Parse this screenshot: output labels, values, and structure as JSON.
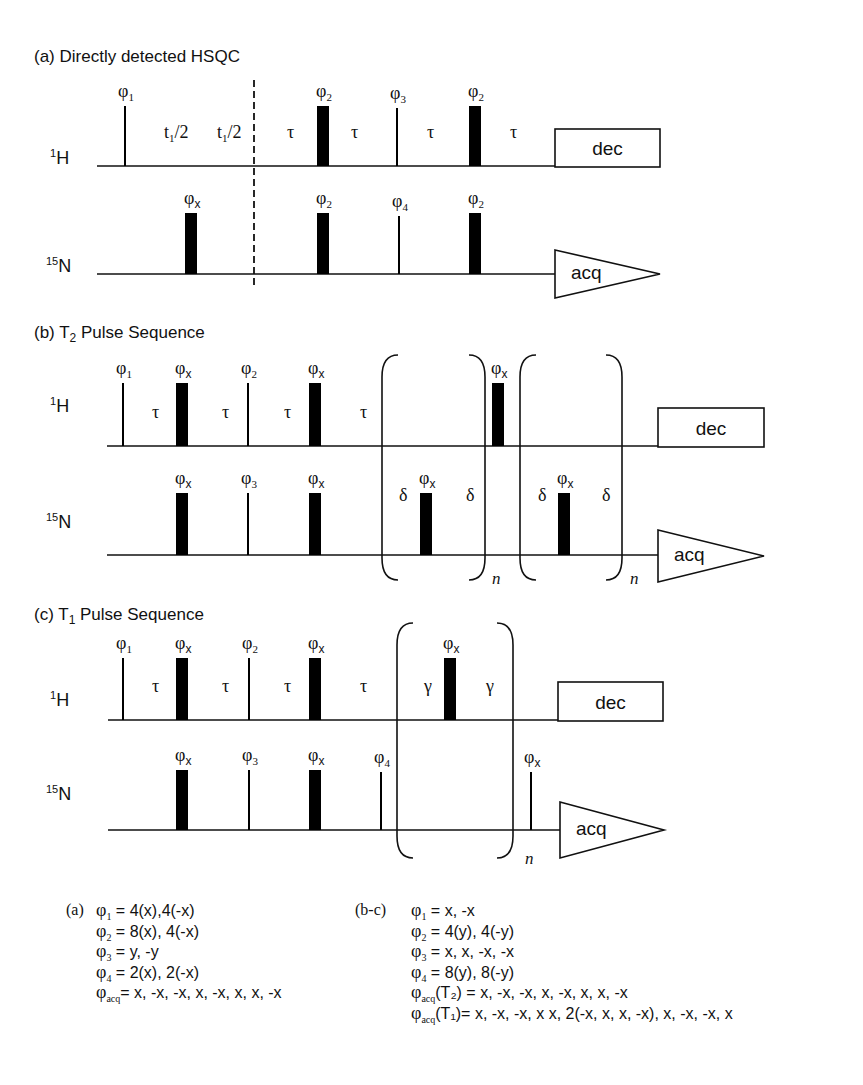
{
  "figure": {
    "panels": [
      {
        "id": "a",
        "title": "(a) Directly detected HSQC",
        "title_pos": [
          34,
          62
        ],
        "channels": [
          {
            "label_sup": "1",
            "label_main": "H",
            "label_pos": [
              50,
              164
            ],
            "baseline_y": 166,
            "x_start": 97,
            "x_end": 555
          },
          {
            "label_sup": "15",
            "label_main": "N",
            "label_pos": [
              46,
              272
            ],
            "baseline_y": 274,
            "x_start": 97,
            "x_end": 555
          }
        ],
        "pulses": [
          {
            "ch": 0,
            "x": 125,
            "w": 2,
            "h": 60,
            "phase": "φ",
            "sub": "1"
          },
          {
            "ch": 0,
            "x": 323,
            "w": 12,
            "h": 60,
            "phase": "φ",
            "sub": "2"
          },
          {
            "ch": 0,
            "x": 397,
            "w": 2,
            "h": 58,
            "phase": "φ",
            "sub": "3"
          },
          {
            "ch": 0,
            "x": 475,
            "w": 12,
            "h": 60,
            "phase": "φ",
            "sub": "2"
          },
          {
            "ch": 1,
            "x": 191,
            "w": 12,
            "h": 61,
            "phase": "φ",
            "sub": "x"
          },
          {
            "ch": 1,
            "x": 323,
            "w": 12,
            "h": 61,
            "phase": "φ",
            "sub": "2"
          },
          {
            "ch": 1,
            "x": 399,
            "w": 2,
            "h": 58,
            "phase": "φ",
            "sub": "4"
          },
          {
            "ch": 1,
            "x": 475,
            "w": 12,
            "h": 61,
            "phase": "φ",
            "sub": "2"
          }
        ],
        "delays": [
          {
            "ch": 0,
            "x": 170,
            "text": "t",
            "sub": "1",
            "tail": "/2"
          },
          {
            "ch": 0,
            "x": 223,
            "text": "t",
            "sub": "1",
            "tail": "/2"
          },
          {
            "ch": 0,
            "x": 293,
            "text": "τ"
          },
          {
            "ch": 0,
            "x": 357,
            "text": "τ"
          },
          {
            "ch": 0,
            "x": 433,
            "text": "τ"
          },
          {
            "ch": 0,
            "x": 516,
            "text": "τ"
          }
        ],
        "dashed_line": {
          "x": 254,
          "y1": 80,
          "y2": 287
        },
        "dec": {
          "x": 555,
          "y": 129,
          "w": 105,
          "h": 38,
          "label": "dec"
        },
        "acq": {
          "x": 555,
          "y": 250,
          "w": 105,
          "h": 48,
          "label": "acq"
        },
        "brackets": []
      },
      {
        "id": "b",
        "title": "(b) T",
        "title_sub": "2",
        "title_tail": " Pulse Sequence",
        "title_pos": [
          34,
          338
        ],
        "channels": [
          {
            "label_sup": "1",
            "label_main": "H",
            "label_pos": [
              50,
              412
            ],
            "baseline_y": 446,
            "x_start": 107,
            "x_end": 658
          },
          {
            "label_sup": "15",
            "label_main": "N",
            "label_pos": [
              46,
              528
            ],
            "baseline_y": 555,
            "x_start": 107,
            "x_end": 658
          }
        ],
        "pulses": [
          {
            "ch": 0,
            "x": 123,
            "w": 2,
            "h": 63,
            "phase": "φ",
            "sub": "1"
          },
          {
            "ch": 0,
            "x": 182,
            "w": 12,
            "h": 63,
            "phase": "φ",
            "sub": "x"
          },
          {
            "ch": 0,
            "x": 248,
            "w": 2,
            "h": 63,
            "phase": "φ",
            "sub": "2"
          },
          {
            "ch": 0,
            "x": 315,
            "w": 12,
            "h": 63,
            "phase": "φ",
            "sub": "x"
          },
          {
            "ch": 0,
            "x": 498,
            "w": 12,
            "h": 63,
            "phase": "φ",
            "sub": "x"
          },
          {
            "ch": 1,
            "x": 182,
            "w": 12,
            "h": 62,
            "phase": "φ",
            "sub": "x"
          },
          {
            "ch": 1,
            "x": 248,
            "w": 2,
            "h": 62,
            "phase": "φ",
            "sub": "3"
          },
          {
            "ch": 1,
            "x": 315,
            "w": 12,
            "h": 62,
            "phase": "φ",
            "sub": "x"
          },
          {
            "ch": 1,
            "x": 426,
            "w": 12,
            "h": 62,
            "phase": "φ",
            "sub": "x"
          },
          {
            "ch": 1,
            "x": 564,
            "w": 12,
            "h": 62,
            "phase": "φ",
            "sub": "x"
          }
        ],
        "delays": [
          {
            "ch": 0,
            "x": 158,
            "text": "τ"
          },
          {
            "ch": 0,
            "x": 228,
            "text": "τ"
          },
          {
            "ch": 0,
            "x": 290,
            "text": "τ"
          },
          {
            "ch": 0,
            "x": 366,
            "text": "τ"
          },
          {
            "ch": 1,
            "x": 405,
            "text": "δ",
            "dy": -26
          },
          {
            "ch": 1,
            "x": 472,
            "text": "δ",
            "dy": -26
          },
          {
            "ch": 1,
            "x": 544,
            "text": "δ",
            "dy": -26
          },
          {
            "ch": 1,
            "x": 608,
            "text": "δ",
            "dy": -26
          }
        ],
        "dec": {
          "x": 658,
          "y": 408,
          "w": 106,
          "h": 39,
          "label": "dec"
        },
        "acq": {
          "x": 658,
          "y": 530,
          "w": 106,
          "h": 52,
          "label": "acq"
        },
        "brackets": [
          {
            "x1": 382,
            "x2": 485,
            "y1": 355,
            "y2": 580,
            "n_label": "n",
            "n_x": 492,
            "n_y": 584
          },
          {
            "x1": 520,
            "x2": 622,
            "y1": 355,
            "y2": 580,
            "n_label": "n",
            "n_x": 630,
            "n_y": 584
          }
        ]
      },
      {
        "id": "c",
        "title": "(c) T",
        "title_sub": "1",
        "title_tail": " Pulse Sequence",
        "title_pos": [
          34,
          620
        ],
        "channels": [
          {
            "label_sup": "1",
            "label_main": "H",
            "label_pos": [
              50,
              706
            ],
            "baseline_y": 720,
            "x_start": 108,
            "x_end": 558
          },
          {
            "label_sup": "15",
            "label_main": "N",
            "label_pos": [
              46,
              800
            ],
            "baseline_y": 830,
            "x_start": 108,
            "x_end": 560
          }
        ],
        "pulses": [
          {
            "ch": 0,
            "x": 123,
            "w": 2,
            "h": 62,
            "phase": "φ",
            "sub": "1"
          },
          {
            "ch": 0,
            "x": 182,
            "w": 12,
            "h": 62,
            "phase": "φ",
            "sub": "x"
          },
          {
            "ch": 0,
            "x": 249,
            "w": 2,
            "h": 62,
            "phase": "φ",
            "sub": "2"
          },
          {
            "ch": 0,
            "x": 315,
            "w": 12,
            "h": 62,
            "phase": "φ",
            "sub": "x"
          },
          {
            "ch": 0,
            "x": 450,
            "w": 12,
            "h": 62,
            "phase": "φ",
            "sub": "x"
          },
          {
            "ch": 1,
            "x": 182,
            "w": 12,
            "h": 60,
            "phase": "φ",
            "sub": "x"
          },
          {
            "ch": 1,
            "x": 249,
            "w": 2,
            "h": 60,
            "phase": "φ",
            "sub": "3"
          },
          {
            "ch": 1,
            "x": 315,
            "w": 12,
            "h": 60,
            "phase": "φ",
            "sub": "x"
          },
          {
            "ch": 1,
            "x": 381,
            "w": 2,
            "h": 58,
            "phase": "φ",
            "sub": "4"
          },
          {
            "ch": 1,
            "x": 531,
            "w": 2,
            "h": 58,
            "phase": "φ",
            "sub": "x"
          }
        ],
        "delays": [
          {
            "ch": 0,
            "x": 158,
            "text": "τ"
          },
          {
            "ch": 0,
            "x": 228,
            "text": "τ"
          },
          {
            "ch": 0,
            "x": 290,
            "text": "τ"
          },
          {
            "ch": 0,
            "x": 366,
            "text": "τ"
          },
          {
            "ch": 0,
            "x": 430,
            "text": "γ"
          },
          {
            "ch": 0,
            "x": 492,
            "text": "γ"
          }
        ],
        "dec": {
          "x": 558,
          "y": 682,
          "w": 105,
          "h": 39,
          "label": "dec"
        },
        "acq": {
          "x": 560,
          "y": 802,
          "w": 104,
          "h": 56,
          "label": "acq"
        },
        "brackets": [
          {
            "x1": 397,
            "x2": 513,
            "y1": 623,
            "y2": 858,
            "n_label": "n",
            "n_x": 525,
            "n_y": 864
          }
        ]
      }
    ]
  },
  "phase_cycles": {
    "a": {
      "tag": "(a)",
      "lines": [
        {
          "sym": "φ",
          "sub": "1",
          "text": " = 4(x),4(-x)"
        },
        {
          "sym": "φ",
          "sub": "2",
          "text": " = 8(x), 4(-x)"
        },
        {
          "sym": "φ",
          "sub": "3",
          "text": " = y, -y"
        },
        {
          "sym": "φ",
          "sub": "4",
          "text": " = 2(x), 2(-x)"
        },
        {
          "sym": "φ",
          "sub": "acq",
          "text": "= x, -x, -x, x, -x, x, x, -x"
        }
      ]
    },
    "bc": {
      "tag": "(b-c)",
      "lines": [
        {
          "sym": "φ",
          "sub": "1",
          "text": " = x, -x"
        },
        {
          "sym": "φ",
          "sub": "2",
          "text": " = 4(y), 4(-y)"
        },
        {
          "sym": "φ",
          "sub": "3",
          "text": " = x, x, -x, -x"
        },
        {
          "sym": "φ",
          "sub": "4",
          "text": " = 8(y), 8(-y)"
        },
        {
          "sym": "φ",
          "sub": "acq",
          "text": "(T₂) = x, -x, -x, x, -x, x, x, -x"
        },
        {
          "sym": "φ",
          "sub": "acq",
          "text": "(T₁)= x, -x, -x, x x, 2(-x, x, x, -x), x, -x, -x, x"
        }
      ]
    }
  }
}
